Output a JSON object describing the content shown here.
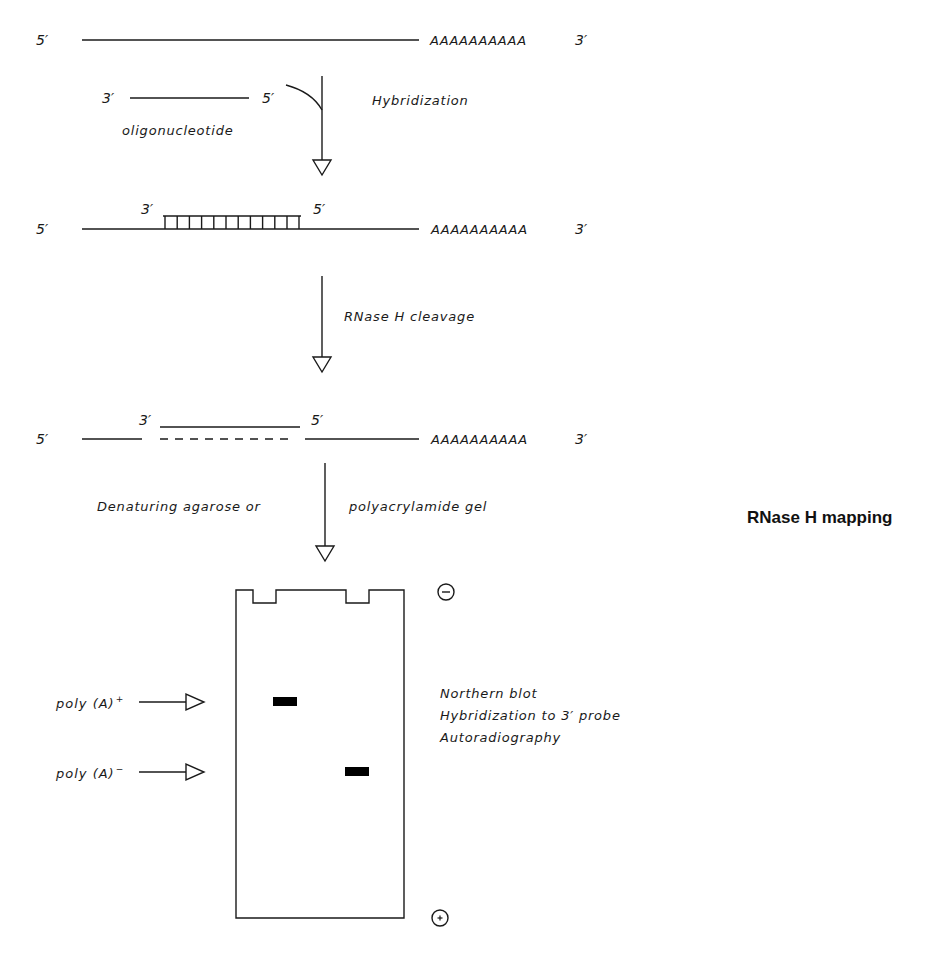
{
  "figure": {
    "title": "RNase H mapping",
    "step1": {
      "mrna": {
        "five_prime": "5′",
        "polyA_tail": "AAAAAAAAAA",
        "three_prime": "3′"
      },
      "oligo": {
        "three_prime": "3′",
        "five_prime": "5′",
        "label": "oligonucleotide"
      },
      "arrow_label": "Hybridization"
    },
    "step2": {
      "mrna": {
        "five_prime": "5′",
        "polyA_tail": "AAAAAAAAAA",
        "three_prime": "3′"
      },
      "hybrid": {
        "three_prime": "3′",
        "five_prime": "5′",
        "rungs": 12
      },
      "arrow_label": "RNase H cleavage"
    },
    "step3": {
      "mrna": {
        "five_prime": "5′",
        "polyA_tail": "AAAAAAAAAA",
        "three_prime": "3′"
      },
      "oligo": {
        "three_prime": "3′",
        "five_prime": "5′"
      },
      "arrow_label_left": "Denaturing agarose or",
      "arrow_label_right": "polyacrylamide gel"
    },
    "gel": {
      "cathode_symbol": "−",
      "anode_symbol": "+",
      "bands": [
        {
          "label": "poly (A)",
          "superscript": "+",
          "lane": 1
        },
        {
          "label": "poly (A)",
          "superscript": "−",
          "lane": 2
        }
      ],
      "notes": [
        "Northern blot",
        "Hybridization to 3′ probe",
        "Autoradiography"
      ]
    }
  }
}
